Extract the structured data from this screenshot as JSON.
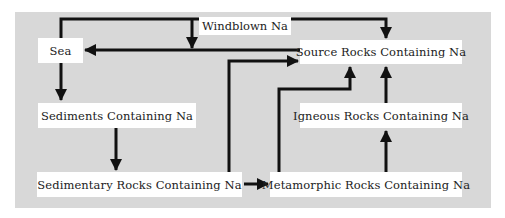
{
  "diagram": {
    "nodes": {
      "sea": "Sea",
      "source_rocks": "Source Rocks Containing Na",
      "sediments": "Sediments Containing Na",
      "igneous_rocks": "Igneous Rocks Containing Na",
      "sedimentary_rocks": "Sedimentary Rocks Containing Na",
      "metamorphic_rocks": "Metamorphic Rocks Containing Na"
    },
    "edge_labels": {
      "windblown": "Windblown Na"
    },
    "edges": [
      {
        "from": "sea",
        "to": "source_rocks",
        "label": "Windblown Na"
      },
      {
        "from": "source_rocks",
        "to": "sea"
      },
      {
        "from": "sea",
        "to": "sediments"
      },
      {
        "from": "sediments",
        "to": "sedimentary_rocks"
      },
      {
        "from": "sedimentary_rocks",
        "to": "metamorphic_rocks"
      },
      {
        "from": "sedimentary_rocks",
        "to": "source_rocks"
      },
      {
        "from": "metamorphic_rocks",
        "to": "source_rocks"
      },
      {
        "from": "metamorphic_rocks",
        "to": "igneous_rocks"
      },
      {
        "from": "igneous_rocks",
        "to": "source_rocks"
      }
    ],
    "colors": {
      "background": "#d8d8d8",
      "box": "#ffffff",
      "arrow": "#111111"
    }
  }
}
